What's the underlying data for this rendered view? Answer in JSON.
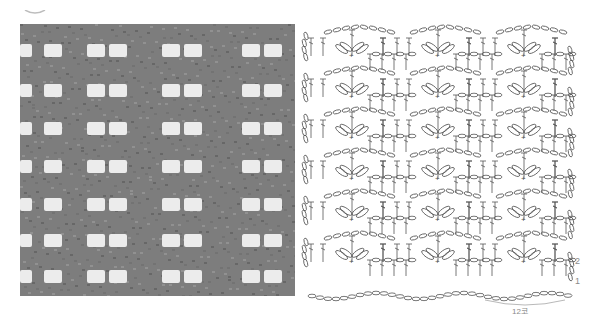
{
  "figure": {
    "corner_icon": "yarn-ball-icon",
    "photo": {
      "name": "crochet-swatch-photo",
      "color_yarn": "#7d7d7d",
      "color_hole": "#ececec",
      "hole_rows": 7,
      "hole_groups_per_row": 4,
      "holes_per_group": 2
    },
    "chart": {
      "name": "crochet-stitch-chart",
      "line_color": "#555555",
      "row_labels": [
        {
          "text": "2",
          "row": 2
        },
        {
          "text": "1",
          "row": 1
        }
      ],
      "repeat_label": "12코",
      "repeat_count_label": "12 stitches",
      "pattern_repeats": 3,
      "row_pairs": 6
    }
  }
}
